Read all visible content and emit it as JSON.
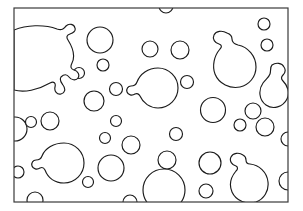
{
  "artwork": {
    "title": "Bubbles Line Art",
    "description": "Black outline drawing of many overlapping soap bubbles inside a rectangular frame",
    "style": "coloring-page-line-art",
    "background_color": "#ffffff",
    "stroke_color": "#1b1b1b",
    "frame_color": "#3a3a3a",
    "stroke_width": 1.15,
    "frame_stroke_width": 1.2,
    "canvas": {
      "width": 303,
      "height": 211
    },
    "frame": {
      "x": 14,
      "y": 8,
      "width": 274,
      "height": 194
    }
  },
  "shapes": {
    "plain_bubbles": [
      {
        "name": "bubble-top-edge-notch",
        "cx": 166,
        "cy": 6,
        "r": 7
      },
      {
        "name": "bubble-upper-left-medium",
        "cx": 100,
        "cy": 40,
        "r": 13
      },
      {
        "name": "bubble-upper-mid-small",
        "cx": 150,
        "cy": 49,
        "r": 8
      },
      {
        "name": "bubble-upper-mid-right-small",
        "cx": 180,
        "cy": 50,
        "r": 9
      },
      {
        "name": "bubble-upper-right-tiny",
        "cx": 264,
        "cy": 24,
        "r": 6
      },
      {
        "name": "bubble-upper-right-tiny-2",
        "cx": 267,
        "cy": 45,
        "r": 6
      },
      {
        "name": "bubble-left-mid-tiny",
        "cx": 79,
        "cy": 73,
        "r": 5.5
      },
      {
        "name": "bubble-left-mid-small",
        "cx": 103,
        "cy": 65,
        "r": 6
      },
      {
        "name": "bubble-mid-small",
        "cx": 116,
        "cy": 89,
        "r": 6.5
      },
      {
        "name": "bubble-center-right-small",
        "cx": 187,
        "cy": 82,
        "r": 6.5
      },
      {
        "name": "bubble-left-lower-medium",
        "cx": 94,
        "cy": 101,
        "r": 10
      },
      {
        "name": "bubble-right-medium",
        "cx": 213,
        "cy": 110,
        "r": 12.5
      },
      {
        "name": "bubble-right-small",
        "cx": 253,
        "cy": 111,
        "r": 8
      },
      {
        "name": "bubble-right-edge-small",
        "cx": 265,
        "cy": 127,
        "r": 9
      },
      {
        "name": "bubble-right-mid-tiny",
        "cx": 240,
        "cy": 125,
        "r": 6
      },
      {
        "name": "bubble-left-edge-half",
        "cx": 15,
        "cy": 129,
        "r": 12
      },
      {
        "name": "bubble-left-tiny",
        "cx": 31,
        "cy": 122,
        "r": 5.5
      },
      {
        "name": "bubble-left-small",
        "cx": 50,
        "cy": 121,
        "r": 9
      },
      {
        "name": "bubble-mid-lower-tiny",
        "cx": 116,
        "cy": 121,
        "r": 5.5
      },
      {
        "name": "bubble-mid-lower-tiny-2",
        "cx": 105,
        "cy": 138,
        "r": 5.5
      },
      {
        "name": "bubble-mid-lower-small",
        "cx": 131,
        "cy": 145,
        "r": 9
      },
      {
        "name": "bubble-center-small",
        "cx": 176,
        "cy": 134,
        "r": 6.5
      },
      {
        "name": "bubble-lower-left-tiny",
        "cx": 18,
        "cy": 172,
        "r": 6
      },
      {
        "name": "bubble-lower-mid-medium",
        "cx": 111,
        "cy": 168,
        "r": 13
      },
      {
        "name": "bubble-lower-center-small",
        "cx": 167,
        "cy": 160,
        "r": 9
      },
      {
        "name": "bubble-lower-center-tiny",
        "cx": 88,
        "cy": 182,
        "r": 5.5
      },
      {
        "name": "bubble-lower-mid-large",
        "cx": 164,
        "cy": 190,
        "r": 21
      },
      {
        "name": "bubble-lower-right-medium",
        "cx": 210,
        "cy": 163,
        "r": 11
      },
      {
        "name": "bubble-lower-right-tiny",
        "cx": 206,
        "cy": 191,
        "r": 7
      },
      {
        "name": "bubble-bottom-edge-tiny",
        "cx": 35,
        "cy": 200,
        "r": 8
      },
      {
        "name": "bubble-bottom-edge-tiny-2",
        "cx": 130,
        "cy": 202,
        "r": 7
      },
      {
        "name": "bubble-bottom-edge-tiny-3",
        "cx": 253,
        "cy": 191,
        "r": 6
      },
      {
        "name": "bubble-right-edge-cut",
        "cx": 288,
        "cy": 181,
        "r": 9
      },
      {
        "name": "bubble-right-edge-cut-2",
        "cx": 288,
        "cy": 139,
        "r": 7
      }
    ],
    "bumped_bubbles": [
      {
        "name": "blob-large-upper-left",
        "path": "M 14 30 C 26 25 44 24 57 29 C 63 31 64 28 66 26 C 69 23 74 24 75 28 C 76 31 73 33 70 34 C 67 35 66 37 68 40 C 73 48 75 57 72 63 C 70 67 71 69 74 70 C 78 71 80 75 78 78 C 76 81 71 80 69 77 C 67 74 64 74 61 77 C 59 80 61 82 63 85 C 66 89 65 93 61 94 C 57 95 54 91 55 87 C 56 83 54 81 50 83 C 38 90 24 93 14 90 Z"
      },
      {
        "name": "blob-upper-right-with-ear",
        "path": "M 227 33 C 222 30 216 31 214 35 C 212 39 215 43 219 44 C 222 45 222 47 220 49 C 214 56 212 66 215 74 C 219 84 230 89 240 87 C 249 85 256 77 256 67 C 256 56 248 47 238 45 C 234 44 232 42 232 39 C 232 36 230 34 227 33 Z"
      },
      {
        "name": "blob-center-with-nub",
        "path": "M 158 68 C 169 68 178 77 178 88 C 178 99 169 108 158 108 C 150 108 143 103 140 96 C 139 94 137 93 135 94 C 132 96 128 95 127 92 C 126 89 128 86 131 86 C 134 86 136 85 137 82 C 140 74 148 68 158 68 Z"
      },
      {
        "name": "blob-lower-left-with-nub",
        "path": "M 64 143 C 75 143 84 152 84 163 C 84 174 75 183 64 183 C 55 183 48 178 45 170 C 44 168 42 167 40 168 C 37 170 33 169 32 166 C 31 163 33 160 36 160 C 39 160 41 159 42 156 C 45 148 54 143 64 143 Z"
      },
      {
        "name": "blob-lower-right-with-top-nub",
        "path": "M 243 155 C 239 152 233 153 231 157 C 229 161 232 165 236 166 C 238 167 238 169 236 171 C 231 177 229 185 232 192 C 236 201 247 205 256 202 C 264 199 269 191 268 182 C 267 172 259 165 250 164 C 247 164 246 162 246 160 C 246 158 245 156 243 155 Z"
      },
      {
        "name": "blob-right-pear",
        "path": "M 272 65 C 276 62 282 63 284 67 C 286 70 285 73 283 75 C 281 77 281 79 283 81 C 288 86 290 93 287 99 C 283 107 273 110 266 105 C 259 100 258 90 263 83 C 266 79 269 77 270 74 C 271 71 270 67 272 65 Z"
      }
    ]
  }
}
